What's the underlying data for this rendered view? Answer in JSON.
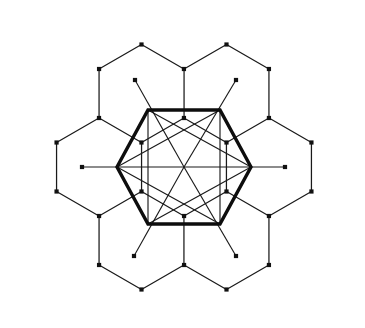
{
  "figure": {
    "canvas": {
      "width": 365,
      "height": 328
    },
    "background_color": "#ffffff",
    "line_color": "#1a1a1a",
    "bold_line_color": "#0d0d0d",
    "dot_color": "#111111",
    "thin_stroke_width": 1.25,
    "bold_stroke_width": 3.4,
    "dot_size": 4.2
  },
  "geometry": {
    "center": {
      "x": 184,
      "y": 167
    },
    "cell_circumradius": 49,
    "cell_centers": [
      {
        "name": "center",
        "x": 184,
        "y": 167
      },
      {
        "name": "east",
        "x": 269,
        "y": 167
      },
      {
        "name": "northeast",
        "x": 226.5,
        "y": 93.5
      },
      {
        "name": "northwest",
        "x": 141.5,
        "y": 93.5
      },
      {
        "name": "west",
        "x": 99,
        "y": 167
      },
      {
        "name": "southwest",
        "x": 141.5,
        "y": 240.5
      },
      {
        "name": "southeast",
        "x": 226.5,
        "y": 240.5
      }
    ],
    "outer_boundary_vertices": [
      {
        "x": 184,
        "y": 20
      },
      {
        "x": 226.5,
        "y": 44.5
      },
      {
        "x": 269,
        "y": 20
      },
      {
        "x": 311.5,
        "y": 44.5
      },
      {
        "x": 311.5,
        "y": 93.5
      },
      {
        "x": 354,
        "y": 118
      },
      {
        "x": 354,
        "y": 167
      },
      {
        "x": 311.5,
        "y": 191.5
      },
      {
        "x": 311.5,
        "y": 240.5
      },
      {
        "x": 269,
        "y": 265
      },
      {
        "x": 269,
        "y": 314
      },
      {
        "x": 226.5,
        "y": 289.5
      },
      {
        "x": 184,
        "y": 314
      },
      {
        "x": 141.5,
        "y": 289.5
      },
      {
        "x": 99,
        "y": 314
      },
      {
        "x": 56.5,
        "y": 289.5
      },
      {
        "x": 56.5,
        "y": 240.5
      },
      {
        "x": 14,
        "y": 216
      },
      {
        "x": 14,
        "y": 167
      },
      {
        "x": 56.5,
        "y": 142.5
      },
      {
        "x": 56.5,
        "y": 93.5
      },
      {
        "x": 99,
        "y": 69
      },
      {
        "x": 99,
        "y": 20
      },
      {
        "x": 141.5,
        "y": 44.5
      }
    ],
    "bold_hexagon_vertices": [
      {
        "x": 251,
        "y": 167
      },
      {
        "x": 220,
        "y": 110
      },
      {
        "x": 148,
        "y": 110
      },
      {
        "x": 117,
        "y": 167
      },
      {
        "x": 148,
        "y": 224
      },
      {
        "x": 220,
        "y": 224
      }
    ],
    "radial_spoke_endpoints": [
      {
        "name": "east-spoke",
        "x": 285,
        "y": 167
      },
      {
        "name": "northeast-spoke",
        "x": 236,
        "y": 80
      },
      {
        "name": "northwest-spoke",
        "x": 135,
        "y": 80
      },
      {
        "name": "west-spoke",
        "x": 82,
        "y": 167
      },
      {
        "name": "southwest-spoke",
        "x": 134,
        "y": 256
      },
      {
        "name": "southeast-spoke",
        "x": 236,
        "y": 256
      }
    ],
    "star_chord_pairs": [
      [
        0,
        2
      ],
      [
        2,
        4
      ],
      [
        4,
        0
      ],
      [
        1,
        3
      ],
      [
        3,
        5
      ],
      [
        5,
        1
      ]
    ]
  },
  "labels": {
    "caption": ""
  }
}
